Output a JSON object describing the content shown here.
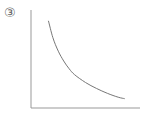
{
  "label": "③",
  "chart_data": {
    "type": "line",
    "title": "",
    "xlabel": "",
    "ylabel": "",
    "xlim": [
      0,
      10
    ],
    "ylim": [
      0,
      10
    ],
    "grid": false,
    "series": [
      {
        "name": "curve",
        "x": [
          1.6,
          2.0,
          2.5,
          3.0,
          3.5,
          4.0,
          5.0,
          6.0,
          7.0,
          8.0,
          8.6
        ],
        "y": [
          8.9,
          7.2,
          5.8,
          4.8,
          4.0,
          3.4,
          2.6,
          2.0,
          1.5,
          1.1,
          0.95
        ]
      }
    ],
    "line_color": "#777777",
    "axis_color": "#999999"
  }
}
